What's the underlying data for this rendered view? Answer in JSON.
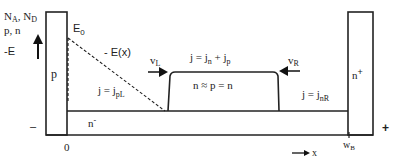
{
  "axis": {
    "y_label_line1": "N",
    "y_label_line1_sub_a": "A",
    "y_label_line1_sep": ", N",
    "y_label_line1_sub_d": "D",
    "y_label_line2": "p, n",
    "y_label_line3": "-E",
    "x_label": "x",
    "origin_label": "0",
    "wb_label": "w",
    "wb_sub": "B"
  },
  "regions": {
    "p_label": "p",
    "n_minus_label": "n",
    "n_minus_sup": "-",
    "n_plus_label": "n",
    "n_plus_sup": "+",
    "plasma_label": "n ≈ p = n"
  },
  "field": {
    "e0_label": "E",
    "e0_sub": "0",
    "ex_label": "- E(x)"
  },
  "currents": {
    "total": "j = j",
    "total_sub_n": "n",
    "total_plus": " + j",
    "total_sub_p": "p",
    "left": "j = j",
    "left_sub": "pL",
    "right": "j = j",
    "right_sub": "nR"
  },
  "velocities": {
    "vl": "v",
    "vl_sub": "L",
    "vr": "v",
    "vr_sub": "R"
  },
  "terminals": {
    "minus": "–",
    "plus": "+"
  }
}
